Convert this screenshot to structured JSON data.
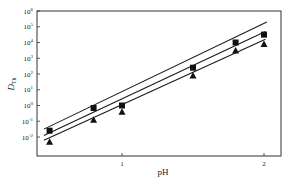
{
  "chart_data": {
    "type": "scatter",
    "title": "",
    "xlabel": "pH",
    "ylabel": "D_Th",
    "ylabel_main": "D",
    "ylabel_sub": "Th",
    "xlim": [
      0.42,
      2.11
    ],
    "ylim_log10": [
      -2.6,
      6
    ],
    "yscale": "log",
    "grid": false,
    "legend": null,
    "x_ticks": [
      {
        "value": 1,
        "label": "1"
      },
      {
        "value": 2,
        "label": "2"
      }
    ],
    "y_ticks": [
      {
        "exp": 6,
        "label": "10",
        "sup": "6"
      },
      {
        "exp": 5,
        "label": "10",
        "sup": "5"
      },
      {
        "exp": 4,
        "label": "10",
        "sup": "4"
      },
      {
        "exp": 3,
        "label": "10",
        "sup": "3"
      },
      {
        "exp": 2,
        "label": "10",
        "sup": "2"
      },
      {
        "exp": 1,
        "label": "10",
        "sup": "1"
      },
      {
        "exp": 0,
        "label": "10",
        "sup": "0"
      },
      {
        "exp": -1,
        "label": "10",
        "sup": "-1"
      },
      {
        "exp": -2,
        "label": "10",
        "sup": "-2"
      }
    ],
    "series": [
      {
        "name": "series-square",
        "marker": "square",
        "x": [
          0.49,
          0.8,
          1.0,
          1.5,
          1.8,
          2.0
        ],
        "log10_y": [
          -1.6,
          -0.16,
          0.0,
          2.4,
          4.0,
          4.5
        ]
      },
      {
        "name": "series-triangle",
        "marker": "triangle",
        "x": [
          0.49,
          0.8,
          1.0,
          1.5,
          1.8,
          2.0
        ],
        "log10_y": [
          -2.3,
          -0.9,
          -0.4,
          1.9,
          3.5,
          3.9
        ]
      }
    ],
    "fit_lines": [
      {
        "name": "fit-top",
        "x": [
          0.45,
          2.02
        ],
        "log10_y": [
          -1.5,
          5.3
        ]
      },
      {
        "name": "fit-middle",
        "x": [
          0.45,
          2.01
        ],
        "log10_y": [
          -1.9,
          4.7
        ]
      },
      {
        "name": "fit-bottom",
        "x": [
          0.45,
          2.01
        ],
        "log10_y": [
          -2.2,
          4.2
        ]
      }
    ],
    "colors": {
      "line": "#1a1a1a",
      "marker": "#111111",
      "axis": "#333333"
    }
  }
}
